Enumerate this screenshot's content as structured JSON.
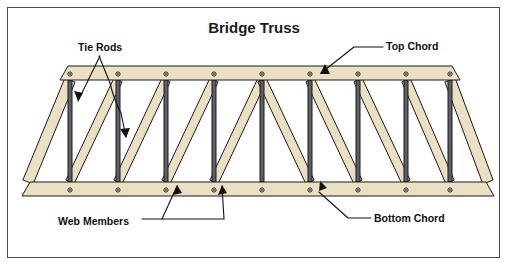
{
  "figure": {
    "title": "Bridge Truss",
    "width": 509,
    "height": 268,
    "background": "#ffffff",
    "frame_color": "#4a4a4a"
  },
  "colors": {
    "wood_fill": "#ece0c4",
    "wood_stroke": "#1a1a1a",
    "rod_fill": "#5d6066",
    "rod_stroke": "#1a1a1a",
    "bolt_fill": "#3a2a1a",
    "bolt_stroke": "#1a1a1a",
    "leader_line": "#111111",
    "text": "#111111"
  },
  "callouts": [
    {
      "id": "tie-rods",
      "label": "Tie Rods",
      "text_x": 78,
      "text_y": 51,
      "anchor": "start"
    },
    {
      "id": "top-chord",
      "label": "Top Chord",
      "text_x": 386,
      "text_y": 50,
      "anchor": "start"
    },
    {
      "id": "web-members",
      "label": "Web Members",
      "text_x": 58,
      "text_y": 225,
      "anchor": "start"
    },
    {
      "id": "bottom-chord",
      "label": "Bottom Chord",
      "text_x": 374,
      "text_y": 222,
      "anchor": "start"
    }
  ],
  "truss": {
    "description": "Symmetric bridge truss with top chord, bottom chord, vertical tie rods and diagonal web members",
    "top_chord": {
      "label": "Top Chord",
      "left_x": 66,
      "right_x": 454,
      "y_top": 66,
      "y_bottom": 80,
      "bolts": 9
    },
    "bottom_chord": {
      "label": "Bottom Chord",
      "left_x": 22,
      "right_x": 494,
      "y_top": 182,
      "y_bottom": 196,
      "bolts": 9
    },
    "panel_points": {
      "count": 9,
      "top_x": [
        70,
        118,
        166,
        214,
        262,
        310,
        358,
        406,
        450
      ],
      "bottom_x": [
        70,
        118,
        166,
        214,
        262,
        310,
        358,
        406,
        450
      ]
    },
    "tie_rods": {
      "label": "Tie Rods",
      "count": 9,
      "width": 4,
      "x_positions": [
        70,
        118,
        166,
        214,
        262,
        310,
        358,
        406,
        450
      ]
    },
    "web_members": {
      "label": "Web Members",
      "count": 8,
      "width": 9,
      "note": "diagonals rise to the right in the left half, mirror in the right half"
    },
    "end_posts": {
      "count": 2,
      "width": 11,
      "note": "splayed end posts from bottom chord ends up to top chord ends"
    }
  },
  "chart_data": {
    "type": "diagram",
    "title": "Bridge Truss",
    "parts": [
      {
        "name": "Top Chord",
        "kind": "wood",
        "quantity": 1
      },
      {
        "name": "Bottom Chord",
        "kind": "wood",
        "quantity": 1
      },
      {
        "name": "Tie Rods",
        "kind": "steel",
        "quantity": 9
      },
      {
        "name": "Web Members",
        "kind": "wood",
        "quantity": 8
      },
      {
        "name": "End Posts",
        "kind": "wood",
        "quantity": 2
      }
    ],
    "labels": [
      "Tie Rods",
      "Top Chord",
      "Web Members",
      "Bottom Chord"
    ]
  }
}
